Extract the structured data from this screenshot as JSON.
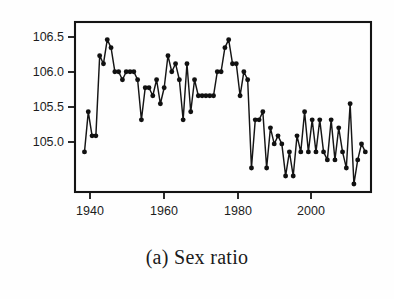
{
  "figure": {
    "caption": "(a) Sex ratio",
    "caption_label": "(a)",
    "caption_text": "Sex ratio"
  },
  "axes": {
    "y_ticks": [
      "106.5",
      "106.0",
      "105.5",
      "105.0"
    ],
    "x_ticks": [
      "1940",
      "1960",
      "1980",
      "2000"
    ]
  },
  "chart_data": {
    "type": "line",
    "title": "(a) Sex ratio",
    "subtitle": "",
    "xlabel": "",
    "ylabel": "",
    "xlim": [
      1935.5,
      2013.5
    ],
    "ylim": [
      104.6,
      106.72
    ],
    "grid": false,
    "legend": false,
    "marker": "filled-circle",
    "line_color": "#151515",
    "marker_color": "#111111",
    "x_tick_values": [
      1940,
      1960,
      1980,
      2000
    ],
    "y_tick_values": [
      106.5,
      106.0,
      105.5,
      105.0
    ],
    "series": [
      {
        "name": "Sex ratio",
        "x": [
          1938,
          1939,
          1940,
          1941,
          1942,
          1943,
          1944,
          1945,
          1946,
          1947,
          1948,
          1949,
          1950,
          1951,
          1952,
          1953,
          1954,
          1955,
          1956,
          1957,
          1958,
          1959,
          1960,
          1961,
          1962,
          1963,
          1964,
          1965,
          1966,
          1967,
          1968,
          1969,
          1970,
          1971,
          1972,
          1973,
          1974,
          1975,
          1976,
          1977,
          1978,
          1979,
          1980,
          1981,
          1982,
          1983,
          1984,
          1985,
          1986,
          1987,
          1988,
          1989,
          1990,
          1991,
          1992,
          1993,
          1994,
          1995,
          1996,
          1997,
          1998,
          1999,
          2000,
          2001,
          2002,
          2003,
          2004,
          2005,
          2006,
          2007,
          2008,
          2009,
          2010,
          2011,
          2012
        ],
        "values": [
          105.1,
          105.6,
          105.3,
          105.3,
          106.3,
          106.2,
          106.5,
          106.4,
          106.1,
          106.1,
          106.0,
          106.1,
          106.1,
          106.1,
          106.0,
          105.5,
          105.9,
          105.9,
          105.8,
          106.0,
          105.7,
          105.9,
          106.3,
          106.1,
          106.2,
          106.0,
          105.5,
          106.2,
          105.6,
          106.0,
          105.8,
          105.8,
          105.8,
          105.8,
          105.8,
          106.1,
          106.1,
          106.4,
          106.5,
          106.2,
          106.2,
          105.8,
          106.1,
          106.0,
          104.9,
          105.5,
          105.5,
          105.6,
          104.9,
          105.4,
          105.2,
          105.3,
          105.2,
          104.8,
          105.1,
          104.8,
          105.3,
          105.1,
          105.6,
          105.1,
          105.5,
          105.1,
          105.5,
          105.1,
          105.0,
          105.5,
          105.0,
          105.4,
          105.1,
          104.9,
          105.7,
          104.7,
          105.0,
          105.2,
          105.1
        ]
      }
    ]
  }
}
